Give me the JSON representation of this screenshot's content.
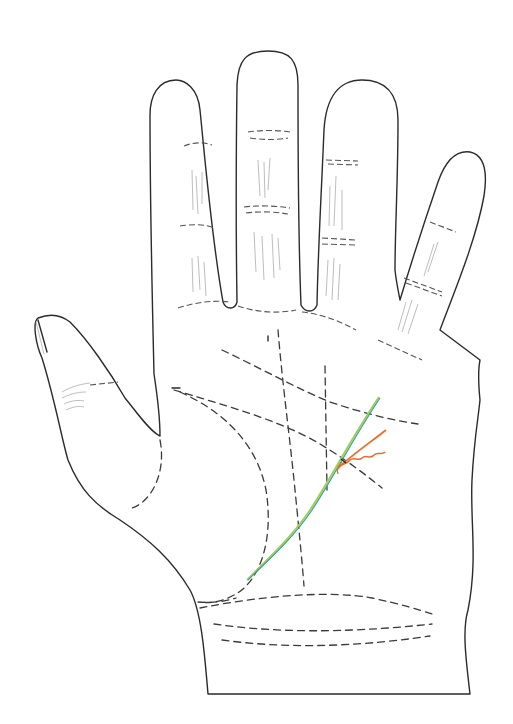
{
  "diagram": {
    "background": "#ffffff",
    "colors": {
      "outline": "#2b2b2b",
      "dashed_lines": "#3a3a3a",
      "finger_creases": "#555555",
      "fine_lines": "#b5b5b5",
      "fate_line_green": "#9ad64a",
      "fate_line_blue": "#3f8fc4",
      "branch_line_orange": "#ee6a2a",
      "wavy_line_orange": "#ee6a2a"
    },
    "elements": [
      {
        "name": "hand-outline",
        "style": "solid"
      },
      {
        "name": "heart-line",
        "style": "dashed"
      },
      {
        "name": "head-line",
        "style": "dashed"
      },
      {
        "name": "life-line",
        "style": "dashed"
      },
      {
        "name": "fate-line",
        "style": "dashed"
      },
      {
        "name": "sun-line",
        "style": "dashed"
      },
      {
        "name": "wrist-bracelets",
        "style": "dashed",
        "count": 3
      },
      {
        "name": "highlighted-line-green-blue",
        "style": "solid"
      },
      {
        "name": "highlighted-branch-orange",
        "style": "solid"
      },
      {
        "name": "highlighted-wavy-orange",
        "style": "solid wavy"
      }
    ]
  }
}
